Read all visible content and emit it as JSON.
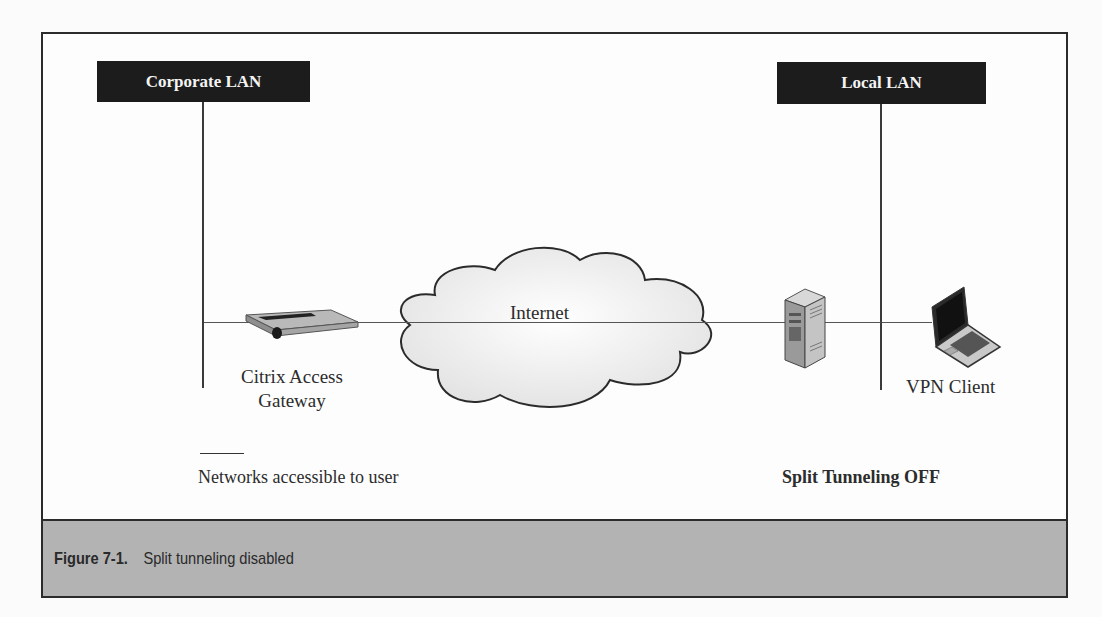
{
  "diagram": {
    "nodes": [
      {
        "id": "corporate-lan",
        "label": "Corporate LAN",
        "type": "network-segment"
      },
      {
        "id": "local-lan",
        "label": "Local LAN",
        "type": "network-segment"
      },
      {
        "id": "gateway",
        "label_line1": "Citrix Access",
        "label_line2": "Gateway",
        "type": "appliance"
      },
      {
        "id": "internet",
        "label": "Internet",
        "type": "cloud"
      },
      {
        "id": "server",
        "label": "",
        "type": "server"
      },
      {
        "id": "vpn-client",
        "label": "VPN Client",
        "type": "laptop"
      }
    ],
    "edges": [
      {
        "from": "corporate-lan",
        "to": "gateway"
      },
      {
        "from": "gateway",
        "to": "internet"
      },
      {
        "from": "internet",
        "to": "server"
      },
      {
        "from": "server",
        "to": "vpn-client"
      }
    ],
    "legend": {
      "line_label": "Networks accessible to user"
    },
    "mode_label": "Split Tunneling OFF"
  },
  "caption": {
    "number": "Figure 7-1.",
    "text": "Split tunneling disabled"
  },
  "colors": {
    "lan_box": "#1c1c1c",
    "caption_band": "#b3b3b3",
    "cloud_fill": "#f2f2f2"
  }
}
